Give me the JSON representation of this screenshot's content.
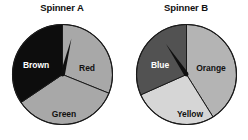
{
  "page": {
    "background": "#ffffff",
    "width": 248,
    "height": 140
  },
  "spinners": [
    {
      "id": "spinner-a",
      "title": "Spinner A",
      "center": {
        "x": 51.5,
        "y": 51.5
      },
      "radius": 50,
      "needle": {
        "angle_deg": -76,
        "length": 37,
        "color": "#101010"
      },
      "sectors": [
        {
          "name": "Red",
          "label": "Red",
          "color": "#a8a8a8",
          "label_color": "#111111",
          "start_deg": -90,
          "end_deg": 22,
          "label_x": 76,
          "label_y": 45
        },
        {
          "name": "Green",
          "label": "Green",
          "color": "#a8a8a8",
          "label_color": "#111111",
          "start_deg": 22,
          "end_deg": 146,
          "label_x": 53,
          "label_y": 91
        },
        {
          "name": "Brown",
          "label": "Brown",
          "color": "#0d0d0d",
          "label_color": "#ffffff",
          "start_deg": 146,
          "end_deg": 270,
          "label_x": 25,
          "label_y": 42
        }
      ]
    },
    {
      "id": "spinner-b",
      "title": "Spinner B",
      "center": {
        "x": 51.5,
        "y": 51.5
      },
      "radius": 50,
      "needle": {
        "angle_deg": -124,
        "length": 37,
        "color": "#101010"
      },
      "sectors": [
        {
          "name": "Orange",
          "label": "Orange",
          "color": "#b4b4b4",
          "label_color": "#111111",
          "start_deg": -90,
          "end_deg": 58,
          "label_x": 76,
          "label_y": 45
        },
        {
          "name": "Yellow",
          "label": "Yellow",
          "color": "#d6d6d6",
          "label_color": "#111111",
          "start_deg": 58,
          "end_deg": 156,
          "label_x": 55,
          "label_y": 91
        },
        {
          "name": "Blue",
          "label": "Blue",
          "color": "#525252",
          "label_color": "#ffffff",
          "start_deg": 156,
          "end_deg": 270,
          "label_x": 25,
          "label_y": 42
        }
      ]
    }
  ],
  "style": {
    "outline_color": "#1a1a1a",
    "outline_width": 1.1,
    "divider_color": "#1a1a1a",
    "divider_width": 1.0
  }
}
